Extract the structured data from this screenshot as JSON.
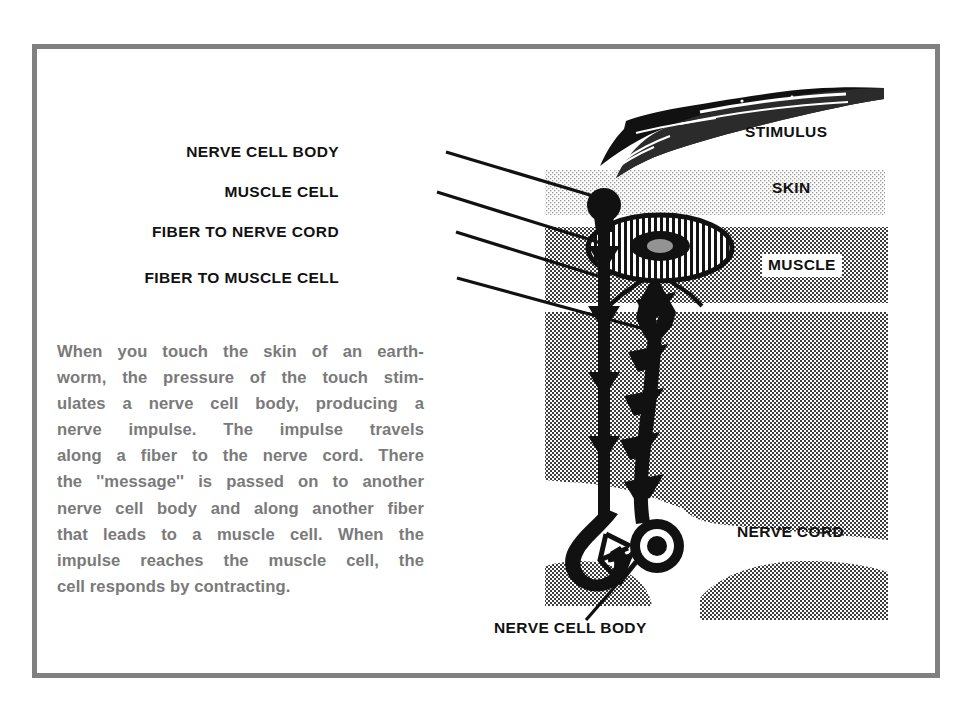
{
  "figure": {
    "border_color": "#808080",
    "background_color": "#ffffff",
    "ink_color": "#111111",
    "body_text_color": "#7a7a7a"
  },
  "labels": {
    "nerve_cell_body_top": "NERVE CELL BODY",
    "muscle_cell": "MUSCLE CELL",
    "fiber_to_nerve_cord": "FIBER TO NERVE CORD",
    "fiber_to_muscle_cell": "FIBER TO MUSCLE CELL",
    "stimulus": "STIMULUS",
    "skin": "SKIN",
    "muscle": "MUSCLE",
    "nerve_cord": "NERVE CORD",
    "nerve_cell_body_bottom": "NERVE CELL BODY"
  },
  "paragraph": {
    "lines": [
      "When you touch the skin of an earth-",
      "worm, the pressure of the touch stim-",
      "ulates a nerve cell body, producing a",
      "nerve impulse. The impulse travels",
      "along a fiber to the nerve cord. There",
      "the ''message'' is passed on to another",
      "nerve cell body and along another fiber",
      "that leads to a muscle cell. When the",
      "impulse reaches the muscle cell, the",
      "cell responds by contracting."
    ],
    "full_text": "When you touch the skin of an earthworm, the pressure of the touch stimulates a nerve cell body, producing a nerve impulse. The impulse travels along a fiber to the nerve cord. There the ''message'' is passed on to another nerve cell body and along another fiber that leads to a muscle cell. When the impulse reaches the muscle cell, the cell responds by contracting."
  },
  "tissue_bands": [
    {
      "name": "skin",
      "label": "SKIN",
      "shade": "light",
      "y_top": 170,
      "y_bottom": 215
    },
    {
      "name": "muscle",
      "label": "MUSCLE",
      "shade": "medium",
      "y_top": 227,
      "y_bottom": 303
    },
    {
      "name": "deep_tissue",
      "label": "",
      "shade": "medium",
      "y_top": 312,
      "y_bottom": 480
    },
    {
      "name": "nerve_cord",
      "label": "NERVE CORD",
      "shade": "medium",
      "y_top": 480,
      "y_bottom": 600
    }
  ],
  "structures": [
    {
      "name": "stimulus-stick",
      "kind": "drawn wooden stick touching the skin"
    },
    {
      "name": "upper-nerve-cell-body",
      "kind": "solid round knob on sensory fiber",
      "x": 604,
      "y": 205
    },
    {
      "name": "muscle-cell",
      "kind": "striated ellipse with dark nucleus",
      "x": 660,
      "y": 248
    },
    {
      "name": "sensory-fiber",
      "kind": "vertical fiber with node bulges running to nerve cord"
    },
    {
      "name": "motor-fiber",
      "kind": "vertical fiber with chevron markers running to muscle cell"
    },
    {
      "name": "lower-nerve-cell-body",
      "kind": "ring with dark center inside nerve cord",
      "x": 657,
      "y": 546
    }
  ]
}
